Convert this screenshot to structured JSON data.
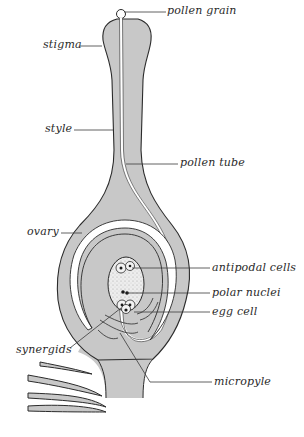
{
  "diagram": {
    "colors": {
      "tissue": "#c8c8c8",
      "outline": "#2b2b2b",
      "sac": "#ececec",
      "background": "#ffffff",
      "leader": "#3a3a3a"
    },
    "labels": {
      "pollen_grain": "pollen grain",
      "stigma": "stigma",
      "style": "style",
      "pollen_tube": "pollen tube",
      "ovary": "ovary",
      "antipodal_cells": "antipodal cells",
      "polar_nuclei": "polar nuclei",
      "egg_cell": "egg cell",
      "synergids": "synergids",
      "micropyle": "micropyle"
    }
  }
}
